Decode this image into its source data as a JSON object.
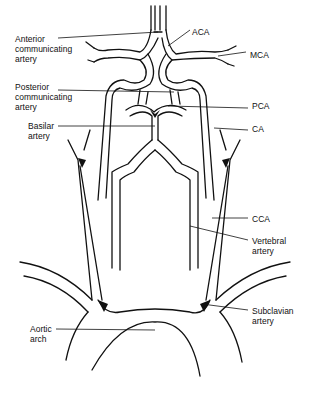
{
  "diagram": {
    "labels": {
      "anterior_communicating": "Anterior\ncommunicating\nartery",
      "aca": "ACA",
      "mca": "MCA",
      "posterior_communicating": "Posterior\ncommunicating\nartery",
      "pca": "PCA",
      "basilar": "Basilar\nartery",
      "ca": "CA",
      "cca": "CCA",
      "vertebral": "Vertebral\nartery",
      "subclavian": "Subclavian\nartery",
      "aortic_arch": "Aortic\narch"
    },
    "colors": {
      "line": "#111111",
      "background": "#ffffff"
    }
  }
}
